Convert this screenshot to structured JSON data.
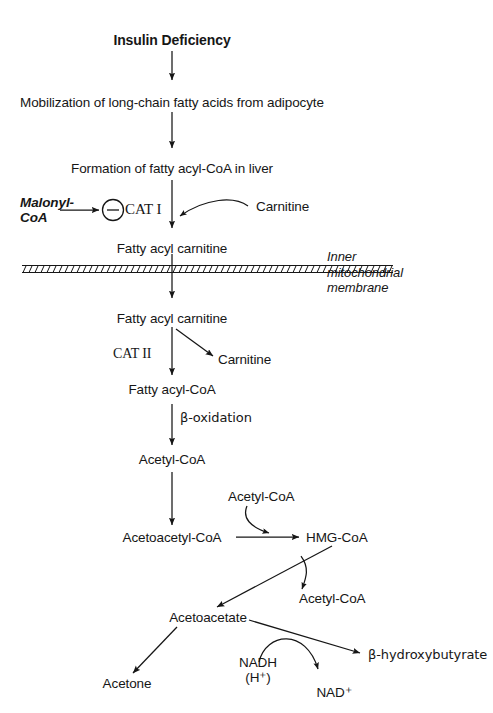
{
  "figure": {
    "type": "flowchart",
    "line_color": "#161616",
    "background": "#ffffff",
    "width": 493,
    "height": 713
  },
  "nodes": {
    "insulin_deficiency": "Insulin Deficiency",
    "mobilization": "Mobilization of long-chain fatty acids from adipocyte",
    "formation": "Formation of fatty acyl-CoA in liver",
    "malonyl_coa_line1": "Malonyl-",
    "malonyl_coa_line2": "CoA",
    "cat_i": "CAT I",
    "carnitine_in": "Carnitine",
    "fatty_acyl_carnitine_out": "Fatty acyl carnitine",
    "membrane_line1": "Inner",
    "membrane_line2": "mitochondrial",
    "membrane_line3": "membrane",
    "fatty_acyl_carnitine_in": "Fatty acyl carnitine",
    "cat_ii": "CAT II",
    "carnitine_out": "Carnitine",
    "fatty_acyl_coa": "Fatty acyl-CoA",
    "beta_oxidation": "β-oxidation",
    "acetyl_coa_1": "Acetyl-CoA",
    "acetyl_coa_2": "Acetyl-CoA",
    "acetoacetyl_coa": "Acetoacetyl-CoA",
    "hmg_coa": "HMG-CoA",
    "acetyl_coa_3": "Acetyl-CoA",
    "acetoacetate": "Acetoacetate",
    "acetone": "Acetone",
    "nadh": "NADH",
    "nadh_proton": "(H⁺)",
    "nad_plus": "NAD⁺",
    "beta_hydroxybutyrate": "β-hydroxybutyrate"
  },
  "symbols": {
    "inhibition_sign": "−",
    "inhibition_meaning": "inhibition"
  },
  "edges": [
    {
      "name": "insulin-to-mobilization",
      "from": "insulin_deficiency",
      "to": "mobilization",
      "style": "straight-down"
    },
    {
      "name": "mobilization-to-formation",
      "from": "mobilization",
      "to": "formation",
      "style": "straight-down"
    },
    {
      "name": "formation-to-fattyacylcarnitine",
      "from": "formation",
      "to": "fatty_acyl_carnitine_out",
      "style": "straight-down"
    },
    {
      "name": "malonyl-to-cat1",
      "from": "malonyl_coa_line1",
      "to": "cat_i",
      "style": "straight-right"
    },
    {
      "name": "carnitine-into-pathway",
      "from": "carnitine_in",
      "to": "formation-arrow",
      "style": "curved-left"
    },
    {
      "name": "membrane-crossing",
      "from": "fatty_acyl_carnitine_out",
      "to": "fatty_acyl_carnitine_in",
      "style": "straight-down"
    },
    {
      "name": "cat2-conversion",
      "from": "fatty_acyl_carnitine_in",
      "to": "fatty_acyl_coa",
      "style": "straight-down"
    },
    {
      "name": "carnitine-release",
      "from": "fatty_acyl_carnitine_in",
      "to": "carnitine_out",
      "style": "diagonal-down-right"
    },
    {
      "name": "beta-oxidation-edge",
      "from": "fatty_acyl_coa",
      "to": "acetyl_coa_1",
      "style": "straight-down"
    },
    {
      "name": "acetylcoa-to-acetoacetylcoa",
      "from": "acetyl_coa_1",
      "to": "acetoacetyl_coa",
      "style": "straight-down"
    },
    {
      "name": "acetoacetylcoa-to-hmgcoa",
      "from": "acetoacetyl_coa",
      "to": "hmg_coa",
      "style": "straight-right"
    },
    {
      "name": "acetylcoa-into-hmgcoa",
      "from": "acetyl_coa_2",
      "to": "acetoacetylcoa-to-hmgcoa",
      "style": "curved-down-right"
    },
    {
      "name": "hmgcoa-to-acetoacetate",
      "from": "hmg_coa",
      "to": "acetoacetate",
      "style": "diagonal-down-left"
    },
    {
      "name": "acetylcoa-release",
      "from": "hmgcoa-to-acetoacetate",
      "to": "acetyl_coa_3",
      "style": "curved-down-right"
    },
    {
      "name": "acetoacetate-to-acetone",
      "from": "acetoacetate",
      "to": "acetone",
      "style": "diagonal-down-left"
    },
    {
      "name": "acetoacetate-to-bhb",
      "from": "acetoacetate",
      "to": "beta_hydroxybutyrate",
      "style": "diagonal-down-right"
    },
    {
      "name": "nadh-to-nadplus",
      "from": "nadh",
      "to": "nad_plus",
      "style": "curved-over"
    }
  ]
}
